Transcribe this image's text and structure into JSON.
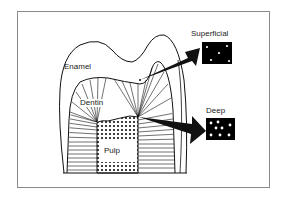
{
  "diagram": {
    "type": "tooth cross-section illustration",
    "labels": {
      "enamel": "Enamel",
      "dentin": "Dentin",
      "pulp": "Pulp",
      "superficial": "Superficial",
      "deep": "Deep"
    },
    "insets": [
      {
        "name": "Superficial",
        "dot_count": 5,
        "description": "sparse dentinal tubules"
      },
      {
        "name": "Deep",
        "dot_count": 8,
        "description": "dense dentinal tubules"
      }
    ],
    "colors": {
      "line": "#111111",
      "fill": "#ffffff",
      "inset_bg": "#000000",
      "inset_dot": "#ffffff",
      "frame": "#8a8a8a"
    }
  }
}
